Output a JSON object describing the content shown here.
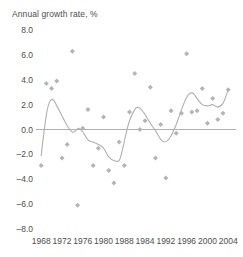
{
  "chart_data": {
    "type": "scatter",
    "title": "Annual growth rate, %",
    "xlabel": "",
    "ylabel": "",
    "xlim": [
      1967,
      2005.5
    ],
    "ylim": [
      -8.0,
      8.0
    ],
    "grid": false,
    "legend": null,
    "zero_line": 0.0,
    "y_ticks": [
      "8.0",
      "6.0",
      "4.0",
      "2.0",
      "0.0",
      "–2.0",
      "–4.0",
      "–6.0",
      "–8.0"
    ],
    "y_tick_values": [
      8.0,
      6.0,
      4.0,
      2.0,
      0.0,
      -2.0,
      -4.0,
      -6.0,
      -8.0
    ],
    "x_ticks": [
      "1968",
      "1972",
      "1976",
      "1980",
      "1988",
      "1984",
      "1992",
      "1996",
      "2000",
      "2004"
    ],
    "x_tick_values": [
      1968,
      1972,
      1976,
      1980,
      1984,
      1988,
      1992,
      1996,
      2000,
      2004
    ],
    "series": [
      {
        "name": "Annual growth rate",
        "marker": "diamond",
        "color": "#b4b4b4",
        "x": [
          1968,
          1969,
          1970,
          1971,
          1972,
          1973,
          1974,
          1975,
          1976,
          1977,
          1978,
          1979,
          1980,
          1981,
          1982,
          1983,
          1984,
          1985,
          1986,
          1987,
          1988,
          1989,
          1990,
          1991,
          1992,
          1993,
          1994,
          1995,
          1996,
          1997,
          1998,
          1999,
          2000,
          2001,
          2002,
          2003,
          2004
        ],
        "y": [
          -2.9,
          3.7,
          3.3,
          3.9,
          -2.3,
          -1.2,
          6.3,
          -6.1,
          0.1,
          1.6,
          -2.9,
          -1.5,
          1.0,
          -3.3,
          -4.3,
          -1.0,
          -2.9,
          1.4,
          4.5,
          0.0,
          0.7,
          3.4,
          -2.3,
          0.4,
          -3.9,
          1.5,
          -0.3,
          1.3,
          6.1,
          1.4,
          1.5,
          3.3,
          0.5,
          2.5,
          0.8,
          1.3,
          3.2
        ]
      }
    ],
    "trend_line": {
      "name": "smoothed trend",
      "color": "#b0b0b0",
      "x": [
        1968,
        1968.3,
        1969,
        1969.6,
        1970.3,
        1971,
        1972,
        1973,
        1974,
        1974.6,
        1975.2,
        1976,
        1976.6,
        1977.2,
        1978,
        1979,
        1980,
        1981,
        1982,
        1983,
        1983.6,
        1984.3,
        1985,
        1986,
        1986.6,
        1987.3,
        1988,
        1989,
        1990,
        1991,
        1991.6,
        1992.3,
        1993,
        1994,
        1995,
        1996,
        1996.6,
        1997.3,
        1998,
        1999,
        2000,
        2001,
        2002,
        2003,
        2004
      ],
      "y": [
        -2.1,
        -1.0,
        1.2,
        2.2,
        2.4,
        1.9,
        1.1,
        0.3,
        -0.2,
        -0.1,
        0.1,
        -0.2,
        -0.6,
        -0.9,
        -1.0,
        -1.2,
        -1.5,
        -2.2,
        -2.5,
        -2.5,
        -1.7,
        -0.4,
        0.7,
        1.6,
        1.8,
        1.6,
        1.2,
        0.5,
        -0.1,
        -0.8,
        -1.0,
        -0.9,
        -0.5,
        0.4,
        1.6,
        2.6,
        2.9,
        2.9,
        2.5,
        2.0,
        1.9,
        2.0,
        1.8,
        2.1,
        3.2
      ]
    }
  }
}
